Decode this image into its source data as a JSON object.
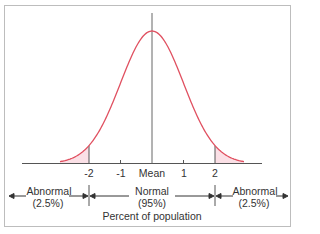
{
  "chart_data": {
    "type": "area",
    "title": "",
    "x_ticks": [
      "-2",
      "-1",
      "Mean",
      "1",
      "2"
    ],
    "x_values": [
      -2,
      -1,
      0,
      1,
      2
    ],
    "xlabel": "Percent of population",
    "regions": [
      {
        "label": "Abnormal",
        "percent": "(2.5%)",
        "range": "< -2"
      },
      {
        "label": "Normal",
        "percent": "(95%)",
        "range": "-2 to 2"
      },
      {
        "label": "Abnormal",
        "percent": "(2.5%)",
        "range": "> 2"
      }
    ],
    "curve_color": "#e05060",
    "tail_fill": "#fbe0e6"
  },
  "ticks": {
    "m2": "-2",
    "m1": "-1",
    "mean": "Mean",
    "p1": "1",
    "p2": "2"
  },
  "regions": {
    "left": {
      "label": "Abnormal",
      "pct": "(2.5%)"
    },
    "center": {
      "label": "Normal",
      "pct": "(95%)"
    },
    "right": {
      "label": "Abnormal",
      "pct": "(2.5%)"
    }
  },
  "xlabel": "Percent of population"
}
